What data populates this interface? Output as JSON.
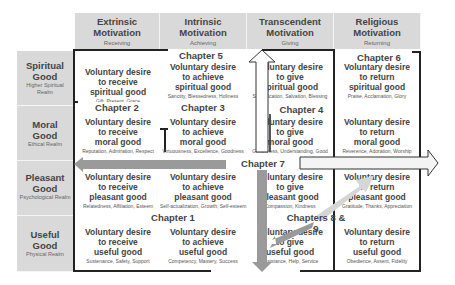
{
  "columns": [
    {
      "title_line1": "Extrinsic",
      "title_line2": "Motivation",
      "sub": "Receiving"
    },
    {
      "title_line1": "Intrinsic",
      "title_line2": "Motivation",
      "sub": "Achieving"
    },
    {
      "title_line1": "Transcendent",
      "title_line2": "Motivation",
      "sub": "Giving"
    },
    {
      "title_line1": "Religious",
      "title_line2": "Motivation",
      "sub": "Returning"
    }
  ],
  "rows": [
    {
      "title_line1": "Spiritual",
      "title_line2": "Good",
      "sub": "Higher Spiritual Realm"
    },
    {
      "title_line1": "Moral",
      "title_line2": "Good",
      "sub": "Ethical Realm"
    },
    {
      "title_line1": "Pleasant",
      "title_line2": "Good",
      "sub": "Psychological Realm"
    },
    {
      "title_line1": "Useful",
      "title_line2": "Good",
      "sub": "Physical Realm"
    }
  ],
  "cells": [
    [
      {
        "l1": "Voluntary desire",
        "l2": "to receive",
        "l3": "spiritual good",
        "sub": "Gift, Present, Grace"
      },
      {
        "l1": "Voluntary desire",
        "l2": "to achieve",
        "l3": "spiritual good",
        "sub": "Sanctity, Blessedness, Holiness"
      },
      {
        "l1": "Voluntary desire",
        "l2": "to give",
        "l3": "spiritual good",
        "sub": "Sanctification, Salvation, Blessing"
      },
      {
        "l1": "Voluntary desire",
        "l2": "to return",
        "l3": "spiritual good",
        "sub": "Praise, Acclamation, Glory"
      }
    ],
    [
      {
        "l1": "Voluntary desire",
        "l2": "to receive",
        "l3": "moral good",
        "sub": "Reputation, Admiration, Respect"
      },
      {
        "l1": "Voluntary desire",
        "l2": "to achieve",
        "l3": "moral good",
        "sub": "Virtuousness, Excellence, Goodness"
      },
      {
        "l1": "Voluntary desire",
        "l2": "to give",
        "l3": "moral good",
        "sub": "Gentleness, Understanding, Good"
      },
      {
        "l1": "Voluntary desire",
        "l2": "to return",
        "l3": "moral good",
        "sub": "Reverence, Adoration, Worship"
      }
    ],
    [
      {
        "l1": "Voluntary desire",
        "l2": "to receive",
        "l3": "pleasant good",
        "sub": "Relatedness, Affiliation, Esteem"
      },
      {
        "l1": "Voluntary desire",
        "l2": "to achieve",
        "l3": "pleasant good",
        "sub": "Self-actualization, Growth, Self-esteem"
      },
      {
        "l1": "Voluntary desire",
        "l2": "to give",
        "l3": "pleasant good",
        "sub": "Compassion, Kindness"
      },
      {
        "l1": "Voluntary desire",
        "l2": "to return",
        "l3": "pleasant good",
        "sub": "Gratitude, Thanks, Appreciation"
      }
    ],
    [
      {
        "l1": "Voluntary desire",
        "l2": "to receive",
        "l3": "useful good",
        "sub": "Sustenance, Safety, Support"
      },
      {
        "l1": "Voluntary desire",
        "l2": "to achieve",
        "l3": "useful good",
        "sub": "Competency, Mastery, Success"
      },
      {
        "l1": "Voluntary desire",
        "l2": "to give",
        "l3": "useful good",
        "sub": "Assistance, Help, Service"
      },
      {
        "l1": "Voluntary desire",
        "l2": "to return",
        "l3": "useful good",
        "sub": "Obedience, Assent, Fidelity"
      }
    ]
  ],
  "chapters": {
    "ch1": "Chapter 1",
    "ch2": "Chapter 2",
    "ch3": "Chapter 3",
    "ch4": "Chapter 4",
    "ch5": "Chapter 5",
    "ch6": "Chapter 6",
    "ch7": "Chapter 7",
    "ch89": "Chapters 8 & 9"
  },
  "colors": {
    "header_bg": "#d9d9d9",
    "arrow_gray": "#9a9a9a",
    "arrow_light": "#cfcfcf",
    "border": "#222222"
  }
}
